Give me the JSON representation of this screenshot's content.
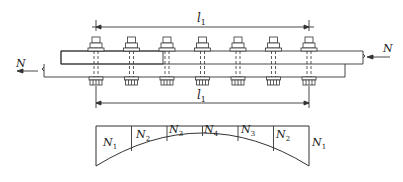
{
  "diagram": {
    "top_dimension": {
      "symbol": "l",
      "subscript": "1"
    },
    "bottom_dimension": {
      "symbol": "l",
      "subscript": "1"
    },
    "left_force": {
      "symbol": "N"
    },
    "right_force": {
      "symbol": "N"
    },
    "bolt_count": 7,
    "distribution_labels": [
      {
        "symbol": "N",
        "subscript": "1"
      },
      {
        "symbol": "N",
        "subscript": "2"
      },
      {
        "symbol": "N",
        "subscript": "3"
      },
      {
        "symbol": "N",
        "subscript": "4"
      },
      {
        "symbol": "N",
        "subscript": "3"
      },
      {
        "symbol": "N",
        "subscript": "2"
      },
      {
        "symbol": "N",
        "subscript": "1"
      }
    ]
  }
}
